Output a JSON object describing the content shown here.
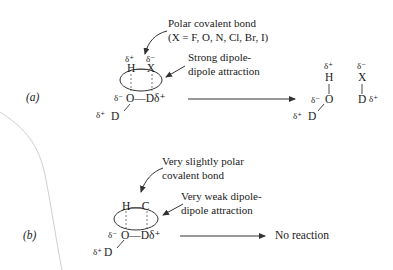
{
  "page_edge": {
    "color": "#c8c8c8"
  },
  "panel_a": {
    "label": "(a)",
    "annotation_bond": {
      "line1": "Polar covalent bond",
      "line2": "(X = F, O, N, Cl, Br, I)"
    },
    "annotation_attraction": {
      "line1": "Strong dipole-",
      "line2": "dipole attraction"
    },
    "reactant": {
      "top_left_delta": "δ⁺",
      "top_right_delta": "δ⁻",
      "top_bond": "H—X",
      "bottom_left_delta": "δ⁻",
      "bottom_bond": "O—Dδ⁺",
      "lower_delta": "δ⁺",
      "lower_atom": "D"
    },
    "product": {
      "h_delta": "δ⁺",
      "h_atom": "H",
      "o_delta": "δ⁻",
      "o_atom": "O",
      "d_delta": "δ⁺",
      "d_atom": "D",
      "x_delta": "δ⁻",
      "x_atom": "X",
      "d2_atom": "D",
      "d2_delta": "δ⁺"
    }
  },
  "panel_b": {
    "label": "(b)",
    "annotation_bond": {
      "line1": "Very slightly polar",
      "line2": "covalent bond"
    },
    "annotation_attraction": {
      "line1": "Very weak dipole-",
      "line2": "dipole attraction"
    },
    "reactant": {
      "top_bond": "H—C",
      "bottom_left_delta": "δ⁻",
      "bottom_bond": "O—Dδ⁺",
      "lower_delta": "δ⁺",
      "lower_atom": "D"
    },
    "result": "No reaction"
  }
}
